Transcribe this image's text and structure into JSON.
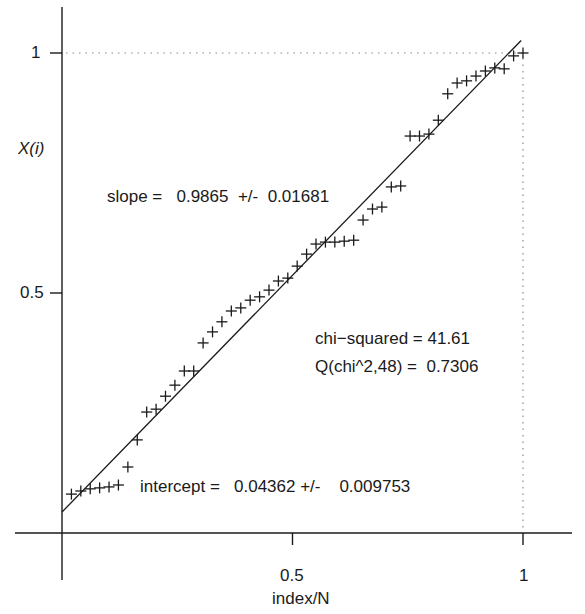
{
  "chart_data": {
    "type": "scatter",
    "title": "",
    "xlabel": "index/N",
    "ylabel": "X(i)",
    "xlim": [
      0,
      1
    ],
    "ylim": [
      0,
      1
    ],
    "grid": false,
    "x_ticks": [
      {
        "value": 0.5,
        "label": "0.5"
      },
      {
        "value": 1,
        "label": "1"
      }
    ],
    "y_ticks": [
      {
        "value": 0.5,
        "label": "0.5"
      },
      {
        "value": 1,
        "label": "1"
      }
    ],
    "reference_lines": [
      {
        "type": "dotted",
        "orientation": "horizontal",
        "y": 1,
        "x_range": [
          0,
          1
        ]
      },
      {
        "type": "dotted",
        "orientation": "vertical",
        "x": 1,
        "y_range": [
          0,
          1
        ]
      }
    ],
    "series": [
      {
        "name": "data",
        "marker": "+",
        "x": [
          0.0204,
          0.0408,
          0.0612,
          0.0816,
          0.102,
          0.1224,
          0.1429,
          0.1633,
          0.1837,
          0.2041,
          0.2245,
          0.2449,
          0.2653,
          0.2857,
          0.3061,
          0.3265,
          0.3469,
          0.3673,
          0.3878,
          0.4082,
          0.4286,
          0.449,
          0.4694,
          0.4898,
          0.5102,
          0.5306,
          0.551,
          0.5714,
          0.5918,
          0.6122,
          0.6327,
          0.6531,
          0.6735,
          0.6939,
          0.7143,
          0.7347,
          0.7551,
          0.7755,
          0.7959,
          0.8163,
          0.8367,
          0.8571,
          0.8776,
          0.898,
          0.9184,
          0.9388,
          0.9592,
          0.9796,
          1.0
        ],
        "y": [
          0.081,
          0.0875,
          0.092,
          0.094,
          0.096,
          0.1,
          0.1375,
          0.194,
          0.252,
          0.258,
          0.285,
          0.308,
          0.3375,
          0.3375,
          0.396,
          0.419,
          0.44,
          0.4625,
          0.469,
          0.485,
          0.492,
          0.506,
          0.525,
          0.531,
          0.556,
          0.581,
          0.602,
          0.606,
          0.606,
          0.608,
          0.61,
          0.652,
          0.675,
          0.679,
          0.721,
          0.723,
          0.827,
          0.827,
          0.831,
          0.86,
          0.915,
          0.9375,
          0.942,
          0.952,
          0.9625,
          0.969,
          0.967,
          0.994,
          1.0
        ]
      },
      {
        "name": "linear fit",
        "type": "line",
        "slope": 0.9865,
        "intercept": 0.04362
      }
    ],
    "annotations": [
      {
        "text": "slope =   0.9865  +/-  0.01681"
      },
      {
        "text": "chi−squared = 41.61"
      },
      {
        "text": "Q(chi^2,48) =  0.7306"
      },
      {
        "text": "intercept =   0.04362 +/-    0.009753"
      }
    ]
  },
  "labels": {
    "ylabel": "X(i)",
    "xlabel": "index/N",
    "xtick_05": "0.5",
    "xtick_1": "1",
    "ytick_05": "0.5",
    "ytick_1": "1",
    "slope": "slope =   0.9865  +/-  0.01681",
    "chi_squared": "chi−squared = 41.61",
    "q_value": "Q(chi^2,48) =  0.7306",
    "intercept": "intercept =   0.04362 +/-    0.009753"
  },
  "colors": {
    "ink": "#1a1a1a",
    "dotted": "#8a8a8a",
    "background": "#ffffff"
  }
}
